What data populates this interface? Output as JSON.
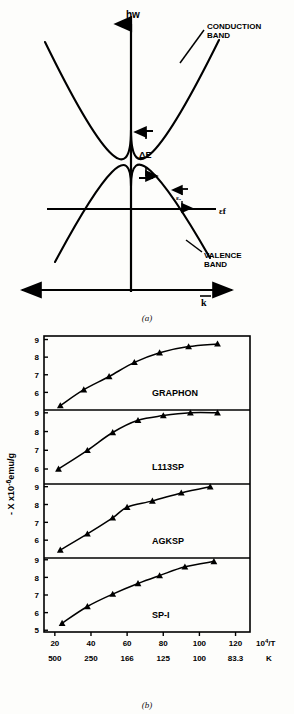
{
  "figure": {
    "panel_a": {
      "caption": "(a)",
      "y_axis_label": "hw",
      "x_axis_label": "k",
      "fermi_label": "εf",
      "gap_label": "ΔE",
      "eps0_label": "εₒ",
      "conduction_label_line1": "CONDUCTION",
      "conduction_label_line2": "BAND",
      "valence_label_line1": "VALENCE",
      "valence_label_line2": "BAND"
    },
    "panel_b": {
      "caption": "(b)"
    }
  },
  "chart_data": {
    "type": "scatter",
    "title": "",
    "xlabel": "10⁴/T",
    "xlabel_sup": "4",
    "xlabel_base": "10",
    "xlabel_tail": "/T",
    "ylabel": "-X x10⁻⁶emu/g",
    "ylabel_parts": {
      "lead": "- X  x10",
      "exp": "-6",
      "tail": "emu/g"
    },
    "secondary_xlabel": "K",
    "xlim": [
      14,
      128
    ],
    "xticks": [
      20,
      40,
      60,
      80,
      100,
      120
    ],
    "xticklabels": [
      "20",
      "40",
      "60",
      "80",
      "100",
      "120"
    ],
    "secondary_xticklabels": [
      "500",
      "250",
      "166",
      "125",
      "100",
      "83.3"
    ],
    "yticks": [
      5,
      6,
      7,
      8,
      9
    ],
    "yticklabels": [
      "5",
      "6",
      "7",
      "8",
      "9"
    ],
    "ylim": [
      4.6,
      9.3
    ],
    "grid": false,
    "legend_position": "inline-right",
    "panels": [
      {
        "name": "GRAPHON",
        "ylim": [
          5.0,
          9.2
        ],
        "yticks": [
          6,
          7,
          8,
          9
        ],
        "x": [
          23,
          36,
          50,
          64,
          78,
          94,
          110
        ],
        "y": [
          5.25,
          6.15,
          6.9,
          7.7,
          8.25,
          8.6,
          8.75
        ]
      },
      {
        "name": "L113SP",
        "ylim": [
          5.2,
          9.15
        ],
        "yticks": [
          6,
          7,
          8,
          9
        ],
        "x": [
          22,
          38,
          52,
          66,
          80,
          95,
          110
        ],
        "y": [
          6.0,
          7.0,
          7.95,
          8.6,
          8.85,
          9.0,
          9.0
        ]
      },
      {
        "name": "AGKSP",
        "ylim": [
          5.0,
          9.15
        ],
        "yticks": [
          6,
          7,
          8,
          9
        ],
        "x": [
          23,
          38,
          52,
          60,
          74,
          90,
          106
        ],
        "y": [
          5.45,
          6.35,
          7.25,
          7.85,
          8.2,
          8.65,
          9.0
        ]
      },
      {
        "name": "SP-I",
        "ylim": [
          4.9,
          9.1
        ],
        "yticks": [
          5,
          6,
          7,
          8,
          9
        ],
        "x": [
          24,
          38,
          52,
          66,
          78,
          92,
          108
        ],
        "y": [
          5.4,
          6.35,
          7.05,
          7.65,
          8.1,
          8.6,
          8.9
        ]
      }
    ]
  }
}
